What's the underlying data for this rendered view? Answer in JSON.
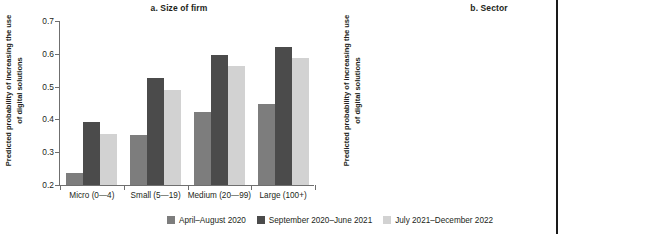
{
  "figure": {
    "legend": [
      {
        "label": "April–August 2020",
        "color": "#7d7d7d"
      },
      {
        "label": "September 2020–June 2021",
        "color": "#4b4b4b"
      },
      {
        "label": "July 2021–December 2022",
        "color": "#d2d2d2"
      }
    ],
    "ylabel": "Predicted probability of increasing the use of digital solutions",
    "yticks": [
      "0.2",
      "0.3",
      "0.4",
      "0.5",
      "0.6",
      "0.7"
    ]
  },
  "chart_data": [
    {
      "type": "bar",
      "title": "a. Size of firm",
      "xlabel": "",
      "ylabel": "Predicted probability of increasing the use of digital solutions",
      "ylim": [
        0.2,
        0.7
      ],
      "yticks": [
        0.2,
        0.3,
        0.4,
        0.5,
        0.6,
        0.7
      ],
      "grid": false,
      "legend_position": "bottom",
      "categories": [
        "Micro (0—4)",
        "Small (5—19)",
        "Medium (20—99)",
        "Large (100+)"
      ],
      "series": [
        {
          "name": "April–August 2020",
          "color": "#7d7d7d",
          "values": [
            0.238,
            0.353,
            0.422,
            0.446
          ]
        },
        {
          "name": "September 2020–June 2021",
          "color": "#4b4b4b",
          "values": [
            0.391,
            0.525,
            0.597,
            0.62
          ]
        },
        {
          "name": "July 2021–December 2022",
          "color": "#d2d2d2",
          "values": [
            0.357,
            0.49,
            0.562,
            0.586
          ]
        }
      ]
    },
    {
      "type": "bar",
      "title": "b. Sector",
      "xlabel": "",
      "ylabel": "Predicted probability of increasing the use of digital solutions",
      "ylim": [
        0.2,
        0.7
      ],
      "yticks": [
        0.2,
        0.3,
        0.4,
        0.5,
        0.6,
        0.7
      ],
      "grid": false,
      "legend_position": "bottom",
      "categories": [
        "Agriculture",
        "Manufacturing",
        "Retail",
        "Other services"
      ],
      "series": [
        {
          "name": "April–August 2020",
          "color": "#7d7d7d",
          "values": [
            0.249,
            0.3,
            0.335,
            0.385
          ]
        },
        {
          "name": "September 2020–June 2021",
          "color": "#4b4b4b",
          "values": [
            0.4,
            0.461,
            0.5,
            0.554
          ]
        },
        {
          "name": "July 2021–December 2022",
          "color": "#d2d2d2",
          "values": [
            0.36,
            0.42,
            0.46,
            0.513
          ]
        }
      ]
    }
  ]
}
